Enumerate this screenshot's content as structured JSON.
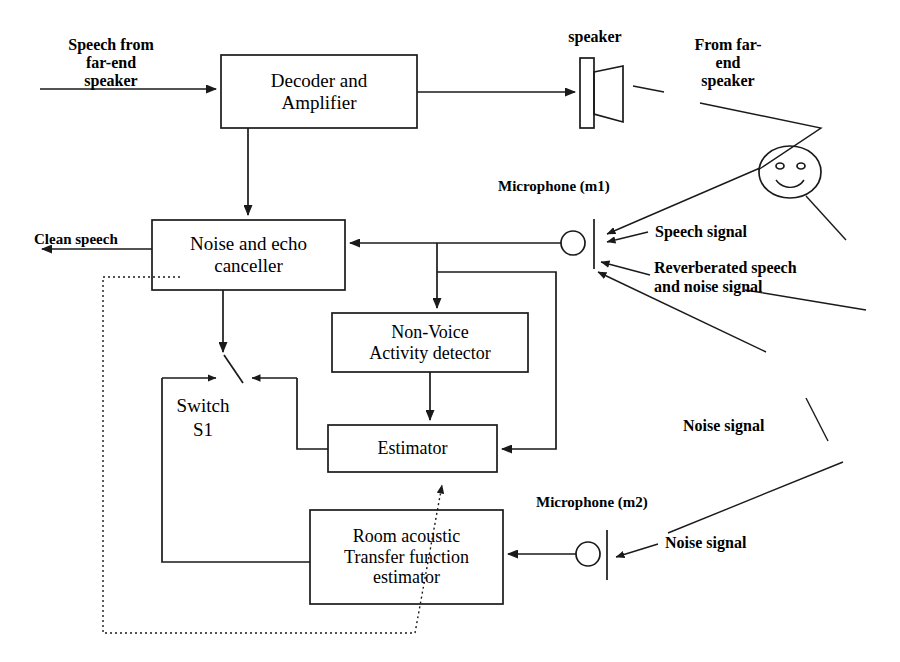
{
  "diagram": {
    "stroke_color": "#1a1a1a",
    "background": "#ffffff",
    "boxes": [
      {
        "id": "decoder",
        "label": "Decoder and\nAmplifier",
        "x": 221,
        "y": 55,
        "w": 196,
        "h": 73,
        "font": 19
      },
      {
        "id": "canceller",
        "label": "Noise and echo\ncanceller",
        "x": 152,
        "y": 220,
        "w": 193,
        "h": 70,
        "font": 19
      },
      {
        "id": "nvad",
        "label": "Non-Voice\nActivity detector",
        "x": 332,
        "y": 313,
        "w": 196,
        "h": 59,
        "font": 18
      },
      {
        "id": "estimator",
        "label": "Estimator",
        "x": 328,
        "y": 425,
        "w": 169,
        "h": 47,
        "font": 18
      },
      {
        "id": "roomacf",
        "label": "Room acoustic\nTransfer function\nestimator",
        "x": 310,
        "y": 510,
        "w": 193,
        "h": 94,
        "font": 18
      }
    ],
    "labels": [
      {
        "id": "speech-from-far-end-speaker",
        "text": "Speech from\nfar-end\nspeaker",
        "x": 36,
        "y": 36,
        "w": 150,
        "font": 16,
        "bold": true,
        "align": "center"
      },
      {
        "id": "speaker-caption",
        "text": "speaker",
        "x": 540,
        "y": 28,
        "w": 110,
        "font": 16,
        "bold": true,
        "align": "center"
      },
      {
        "id": "from-far-end-speaker",
        "text": "From far-\nend\nspeaker",
        "x": 668,
        "y": 36,
        "w": 120,
        "font": 16,
        "bold": true,
        "align": "center"
      },
      {
        "id": "microphone-m1",
        "text": "Microphone (m1)",
        "x": 498,
        "y": 178,
        "w": 170,
        "font": 15,
        "bold": true,
        "align": "left"
      },
      {
        "id": "clean-speech",
        "text": "Clean speech",
        "x": 34,
        "y": 231,
        "w": 130,
        "font": 15,
        "bold": true,
        "align": "left"
      },
      {
        "id": "speech-signal",
        "text": "Speech signal",
        "x": 655,
        "y": 223,
        "w": 145,
        "font": 16,
        "bold": true,
        "align": "left"
      },
      {
        "id": "reverberated-speech",
        "text": "Reverberated speech\nand noise signal",
        "x": 654,
        "y": 258,
        "w": 215,
        "font": 16,
        "bold": true,
        "align": "left"
      },
      {
        "id": "switch-s1",
        "text": "Switch\nS1",
        "x": 148,
        "y": 394,
        "w": 110,
        "font": 19,
        "bold": false,
        "align": "center"
      },
      {
        "id": "noise-signal-upper",
        "text": "Noise signal",
        "x": 683,
        "y": 417,
        "w": 130,
        "font": 16,
        "bold": true,
        "align": "left"
      },
      {
        "id": "microphone-m2",
        "text": "Microphone (m2)",
        "x": 536,
        "y": 494,
        "w": 175,
        "font": 15,
        "bold": true,
        "align": "left"
      },
      {
        "id": "noise-signal-lower",
        "text": "Noise signal",
        "x": 665,
        "y": 534,
        "w": 130,
        "font": 16,
        "bold": true,
        "align": "left"
      }
    ],
    "icons": {
      "speaker": {
        "id": "speaker-icon",
        "box_x": 580,
        "box_y": 58,
        "box_w": 14,
        "box_h": 70,
        "cone_x": 623,
        "cone_top": 66,
        "cone_bottom": 122
      },
      "microphone_m1": {
        "id": "microphone-m1-icon",
        "cx": 573,
        "cy": 243,
        "r": 12,
        "bar_x": 594,
        "bar_top": 219,
        "bar_bottom": 269
      },
      "microphone_m2": {
        "id": "microphone-m2-icon",
        "cx": 588,
        "cy": 554,
        "r": 12,
        "bar_x": 607,
        "bar_top": 530,
        "bar_bottom": 580
      },
      "face": {
        "id": "smiley-face-icon",
        "cx": 790,
        "cy": 172,
        "rx": 31,
        "ry": 26
      }
    },
    "connections": [
      {
        "id": "input-to-decoder",
        "from": "Speech from far-end speaker",
        "to": "Decoder and Amplifier",
        "style": "solid"
      },
      {
        "id": "decoder-to-speaker",
        "from": "Decoder and Amplifier",
        "to": "speaker",
        "style": "solid"
      },
      {
        "id": "decoder-to-canceller",
        "from": "Decoder and Amplifier",
        "to": "Noise and echo canceller",
        "style": "solid"
      },
      {
        "id": "canceller-to-clean-speech",
        "from": "Noise and echo canceller",
        "to": "Clean speech",
        "style": "solid"
      },
      {
        "id": "mic1-to-canceller",
        "from": "Microphone (m1)",
        "to": "Noise and echo canceller",
        "style": "solid"
      },
      {
        "id": "mic1-to-nvad",
        "from": "Microphone (m1)",
        "to": "Non-Voice Activity detector",
        "style": "solid"
      },
      {
        "id": "mic1-to-estimator",
        "from": "Microphone (m1)",
        "to": "Estimator",
        "style": "solid"
      },
      {
        "id": "nvad-to-estimator",
        "from": "Non-Voice Activity detector",
        "to": "Estimator",
        "style": "solid"
      },
      {
        "id": "canceller-to-switch",
        "from": "Noise and echo canceller",
        "to": "Switch S1",
        "style": "solid"
      },
      {
        "id": "estimator-to-switch",
        "from": "Estimator",
        "to": "Switch S1",
        "style": "solid"
      },
      {
        "id": "switch-to-roomacf",
        "from": "Switch S1",
        "to": "Room acoustic Transfer function estimator",
        "style": "solid"
      },
      {
        "id": "mic2-to-roomacf",
        "from": "Microphone (m2)",
        "to": "Room acoustic Transfer function estimator",
        "style": "solid"
      },
      {
        "id": "roomacf-to-estimator-dotted",
        "from": "Room acoustic Transfer function estimator",
        "to": "Estimator",
        "style": "dotted"
      },
      {
        "id": "canceller-feedback-dotted",
        "from": "Noise and echo canceller",
        "to": "Room acoustic Transfer function estimator",
        "style": "dotted"
      }
    ]
  }
}
